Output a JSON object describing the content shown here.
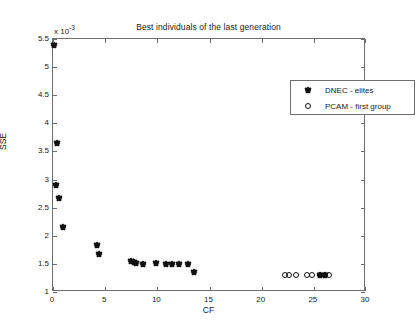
{
  "chart_data": {
    "type": "scatter",
    "title": "Best individuals of the last generation",
    "xlabel": "CF",
    "ylabel": "SSE",
    "y_multiplier": "x 10",
    "y_multiplier_exp": "-3",
    "xlim": [
      0,
      30
    ],
    "ylim": [
      1,
      5.5
    ],
    "xticks": [
      0,
      5,
      10,
      15,
      20,
      25,
      30
    ],
    "xtick_labels": [
      "0",
      "5",
      "10",
      "15",
      "20",
      "25",
      "30"
    ],
    "yticks": [
      1,
      1.5,
      2,
      2.5,
      3,
      3.5,
      4,
      4.5,
      5,
      5.5
    ],
    "ytick_labels": [
      "1",
      "1.5",
      "2",
      "2.5",
      "3",
      "3.5",
      "4",
      "4.5",
      "5",
      "5.5"
    ],
    "grid": false,
    "legend_position": "upper right",
    "series": [
      {
        "name": "DNEC - elites",
        "marker": "filled-diamond",
        "color": "#111111",
        "points": [
          [
            0.05,
            5.4
          ],
          [
            0.35,
            3.65
          ],
          [
            0.3,
            2.9
          ],
          [
            0.62,
            2.68
          ],
          [
            0.92,
            2.15
          ],
          [
            4.2,
            1.83
          ],
          [
            4.45,
            1.68
          ],
          [
            7.5,
            1.55
          ],
          [
            7.8,
            1.54
          ],
          [
            8.0,
            1.52
          ],
          [
            8.6,
            1.5
          ],
          [
            9.9,
            1.52
          ],
          [
            10.8,
            1.5
          ],
          [
            11.4,
            1.49
          ],
          [
            12.1,
            1.5
          ],
          [
            12.9,
            1.5
          ],
          [
            13.5,
            1.36
          ],
          [
            25.6,
            1.3
          ],
          [
            26.1,
            1.3
          ]
        ]
      },
      {
        "name": "PCAM - first group",
        "marker": "open-circle",
        "color": "#111111",
        "points": [
          [
            22.2,
            1.3
          ],
          [
            22.6,
            1.3
          ],
          [
            23.3,
            1.3
          ],
          [
            24.3,
            1.3
          ],
          [
            24.8,
            1.3
          ],
          [
            25.6,
            1.3
          ],
          [
            26.1,
            1.3
          ],
          [
            26.5,
            1.3
          ]
        ]
      }
    ]
  }
}
